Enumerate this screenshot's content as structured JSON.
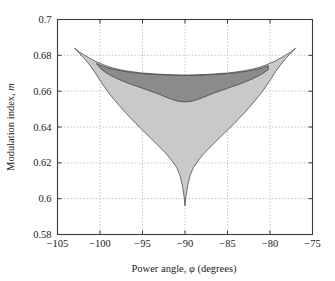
{
  "chart_data": {
    "type": "area",
    "title": "",
    "xlabel": "Power angle, φ (degrees)",
    "xlabel_prefix": "Power angle, ",
    "xlabel_symbol": "φ",
    "xlabel_suffix": " (degrees)",
    "ylabel": "Modulation index, m",
    "ylabel_prefix": "Modulation index, ",
    "ylabel_symbol": "m",
    "xlim": [
      -105,
      -75
    ],
    "ylim": [
      0.58,
      0.7
    ],
    "xticks": [
      -105,
      -100,
      -95,
      -90,
      -85,
      -80,
      -75
    ],
    "yticks": [
      0.58,
      0.6,
      0.62,
      0.64,
      0.66,
      0.68,
      0.7
    ],
    "xticklabels": [
      "−105",
      "−100",
      "−95",
      "−90",
      "−85",
      "−80",
      "−75"
    ],
    "yticklabels": [
      "0.58",
      "0.6",
      "0.62",
      "0.64",
      "0.66",
      "0.68",
      "0.7"
    ],
    "grid": true,
    "grid_style": "dotted",
    "legend": "none",
    "colors": {
      "light_region": "#c9c9c9",
      "dark_region": "#8b8b8b",
      "outline": "#3a3a3a",
      "axis": "#3a3a3a",
      "grid": "#9a9a9a",
      "background": "#ffffff"
    },
    "series": [
      {
        "name": "upper-boundary",
        "note": "outer upper envelope of shaded region",
        "x": [
          -103.0,
          -102.4,
          -101.8,
          -101.2,
          -100.6,
          -100.0,
          -99.4,
          -98.8,
          -98.2,
          -97.6,
          -97.0,
          -96.4,
          -95.8,
          -95.2,
          -94.6,
          -94.0,
          -93.4,
          -92.8,
          -92.2,
          -91.6,
          -91.0,
          -90.4,
          -90.0,
          -89.6,
          -89.0,
          -88.4,
          -87.8,
          -87.2,
          -86.6,
          -86.0,
          -85.4,
          -84.8,
          -84.2,
          -83.6,
          -83.0,
          -82.4,
          -81.8,
          -81.2,
          -80.6,
          -80.0,
          -79.4,
          -78.8,
          -78.2,
          -77.6,
          -77.0
        ],
        "y": [
          0.684,
          0.6818,
          0.68,
          0.6784,
          0.6768,
          0.6756,
          0.6744,
          0.6734,
          0.6726,
          0.672,
          0.6714,
          0.671,
          0.6706,
          0.6702,
          0.67,
          0.6698,
          0.6696,
          0.6694,
          0.6693,
          0.6692,
          0.6691,
          0.669,
          0.669,
          0.669,
          0.6691,
          0.6692,
          0.6693,
          0.6694,
          0.6696,
          0.6698,
          0.67,
          0.6702,
          0.6706,
          0.671,
          0.6714,
          0.672,
          0.6726,
          0.6734,
          0.6744,
          0.6756,
          0.6768,
          0.6784,
          0.68,
          0.6818,
          0.684
        ]
      },
      {
        "name": "dark-region-upper",
        "note": "upper edge of the dark grey band",
        "x": [
          -100.4,
          -99.8,
          -99.2,
          -98.6,
          -98.0,
          -97.4,
          -96.8,
          -96.2,
          -95.6,
          -95.0,
          -94.4,
          -93.8,
          -93.2,
          -92.6,
          -92.0,
          -91.4,
          -90.8,
          -90.0,
          -89.2,
          -88.6,
          -88.0,
          -87.4,
          -86.8,
          -86.2,
          -85.6,
          -85.0,
          -84.4,
          -83.8,
          -83.2,
          -82.6,
          -82.0,
          -81.4,
          -80.8,
          -80.2
        ],
        "y": [
          0.6755,
          0.6742,
          0.6732,
          0.6724,
          0.6718,
          0.6712,
          0.6708,
          0.6704,
          0.6701,
          0.6698,
          0.6696,
          0.6694,
          0.6692,
          0.6691,
          0.669,
          0.6689,
          0.6688,
          0.6688,
          0.6688,
          0.6689,
          0.669,
          0.6691,
          0.6692,
          0.6694,
          0.6696,
          0.6698,
          0.6701,
          0.6704,
          0.6708,
          0.6712,
          0.6718,
          0.6724,
          0.6732,
          0.6742
        ]
      },
      {
        "name": "dark-region-lower",
        "note": "lower edge of the dark grey band; meets light grey region",
        "x": [
          -100.4,
          -99.8,
          -99.2,
          -98.6,
          -98.0,
          -97.4,
          -96.8,
          -96.2,
          -95.6,
          -95.0,
          -94.4,
          -93.8,
          -93.2,
          -92.6,
          -92.0,
          -91.4,
          -90.8,
          -90.0,
          -89.2,
          -88.6,
          -88.0,
          -87.4,
          -86.8,
          -86.2,
          -85.6,
          -85.0,
          -84.4,
          -83.8,
          -83.2,
          -82.6,
          -82.0,
          -81.4,
          -80.8,
          -80.2
        ],
        "y": [
          0.6752,
          0.672,
          0.67,
          0.6684,
          0.667,
          0.6658,
          0.6646,
          0.6636,
          0.6626,
          0.6616,
          0.6606,
          0.6596,
          0.6586,
          0.6574,
          0.6562,
          0.6552,
          0.6544,
          0.654,
          0.6544,
          0.6552,
          0.6562,
          0.6574,
          0.6586,
          0.6596,
          0.6606,
          0.6616,
          0.6626,
          0.6636,
          0.6646,
          0.6658,
          0.667,
          0.6684,
          0.67,
          0.672
        ]
      },
      {
        "name": "lower-boundary",
        "note": "lower envelope of light grey region, V shaped with narrow spike at -90",
        "x": [
          -103.0,
          -102.4,
          -101.8,
          -101.2,
          -100.6,
          -100.0,
          -99.4,
          -98.8,
          -98.2,
          -97.6,
          -97.0,
          -96.4,
          -95.8,
          -95.2,
          -94.6,
          -94.0,
          -93.4,
          -92.8,
          -92.2,
          -91.6,
          -91.0,
          -90.6,
          -90.3,
          -90.1,
          -90.0,
          -89.9,
          -89.7,
          -89.4,
          -89.0,
          -88.4,
          -87.8,
          -87.2,
          -86.6,
          -86.0,
          -85.4,
          -84.8,
          -84.2,
          -83.6,
          -83.0,
          -82.4,
          -81.8,
          -81.2,
          -80.6,
          -80.0,
          -79.4,
          -78.8,
          -78.2,
          -77.6,
          -77.0
        ],
        "y": [
          0.684,
          0.681,
          0.678,
          0.6745,
          0.6705,
          0.666,
          0.6618,
          0.658,
          0.6545,
          0.6512,
          0.648,
          0.645,
          0.642,
          0.6392,
          0.6364,
          0.6336,
          0.6308,
          0.628,
          0.625,
          0.6215,
          0.6175,
          0.613,
          0.607,
          0.601,
          0.596,
          0.601,
          0.607,
          0.613,
          0.6175,
          0.6215,
          0.625,
          0.628,
          0.6308,
          0.6336,
          0.6364,
          0.6392,
          0.642,
          0.645,
          0.648,
          0.6512,
          0.6545,
          0.658,
          0.6618,
          0.666,
          0.6705,
          0.6745,
          0.678,
          0.681,
          0.684
        ]
      }
    ],
    "annotations": []
  }
}
